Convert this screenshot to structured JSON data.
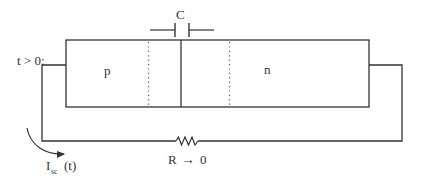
{
  "diagram": {
    "title_condition": "t > 0:",
    "regions": {
      "p_label": "p",
      "n_label": "n"
    },
    "capacitor": {
      "label": "C"
    },
    "resistor": {
      "label": "R",
      "arrow": "→",
      "limit_value": "0"
    },
    "current": {
      "symbol": "I",
      "subscript": "sc",
      "argument": "(t)"
    },
    "colors": {
      "line": "#333333",
      "dotted": "#555555",
      "background": "#ffffff"
    }
  }
}
